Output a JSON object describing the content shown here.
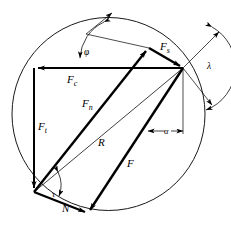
{
  "diagram": {
    "name": "merchant-force-circle",
    "background": "#ffffff",
    "stroke_color": "#000000",
    "canvas": {
      "width": 231,
      "height": 238
    }
  },
  "circle": {
    "name": "merchant-circle",
    "cx": 108.5,
    "cy": 114,
    "r": 96.5,
    "stroke_width": 0.9
  },
  "vertices": {
    "tool_tip": {
      "x": 34,
      "y": 192
    },
    "top_right": {
      "x": 183,
      "y": 68
    },
    "top_left": {
      "x": 34,
      "y": 68
    },
    "shear_apex": {
      "x": 149,
      "y": 48
    },
    "bottom_apex": {
      "x": 88,
      "y": 213
    }
  },
  "forces": [
    {
      "id": "Fc",
      "label": "F",
      "sub": "c",
      "name": "cutting-force",
      "description": "Cutting force, horizontal component",
      "x1": 183,
      "y1": 68,
      "x2": 34,
      "y2": 68,
      "label_x": 67,
      "label_y": 82,
      "stroke_width": 2.0,
      "arrow": "end"
    },
    {
      "id": "Ft",
      "label": "F",
      "sub": "t",
      "name": "thrust-force",
      "description": "Thrust force, vertical component",
      "x1": 34,
      "y1": 68,
      "x2": 34,
      "y2": 192,
      "label_x": 38,
      "label_y": 128,
      "stroke_width": 2.0,
      "arrow": "end"
    },
    {
      "id": "Fn",
      "label": "F",
      "sub": "n",
      "name": "normal-force-shear-plane",
      "description": "Normal force on the shear plane",
      "x1": 34,
      "y1": 192,
      "x2": 149,
      "y2": 48,
      "label_x": 83,
      "label_y": 105,
      "stroke_width": 2.4,
      "arrow": "end"
    },
    {
      "id": "Fs",
      "label": "F",
      "sub": "s",
      "name": "shear-force",
      "description": "Shear force along the shear plane",
      "x1": 149,
      "y1": 48,
      "x2": 183,
      "y2": 68,
      "label_x": 161,
      "label_y": 47,
      "stroke_width": 2.4,
      "arrow": "end"
    },
    {
      "id": "R",
      "label": "R",
      "sub": "",
      "name": "resultant-force",
      "description": "Resultant force (circle diameter)",
      "x1": 183,
      "y1": 68,
      "x2": 34,
      "y2": 192,
      "label_x": 99,
      "label_y": 143,
      "stroke_width": 0.8,
      "arrow": "none"
    },
    {
      "id": "F",
      "label": "F",
      "sub": "",
      "name": "friction-force",
      "description": "Friction force along the tool rake face",
      "x1": 183,
      "y1": 68,
      "x2": 88,
      "y2": 213,
      "label_x": 128,
      "label_y": 165,
      "stroke_width": 2.4,
      "arrow": "end"
    },
    {
      "id": "N",
      "label": "N",
      "sub": "",
      "name": "normal-force-rake-face",
      "description": "Normal force on the tool rake face",
      "x1": 34,
      "y1": 192,
      "x2": 88,
      "y2": 213,
      "label_x": 66,
      "label_y": 209,
      "stroke_width": 2.4,
      "arrow": "end"
    }
  ],
  "angles": [
    {
      "id": "phi",
      "symbol": "φ",
      "name": "shear-angle-phi",
      "description": "Shear plane angle",
      "label_x": 88,
      "label_y": 52
    },
    {
      "id": "lambda",
      "symbol": "λ",
      "name": "friction-angle-lambda",
      "description": "Friction angle at the tool rake face",
      "label_x": 211,
      "label_y": 66
    },
    {
      "id": "alpha",
      "symbol": "α",
      "name": "rake-angle-alpha",
      "description": "Tool rake angle",
      "label_x": 156,
      "label_y": 134
    },
    {
      "id": "tau",
      "symbol": "τ",
      "name": "angle-tau",
      "description": "Angle between resultant and normal force at the tool tip",
      "label_x": 55,
      "label_y": 196
    }
  ],
  "construction_lines": [
    {
      "name": "shear-plane-extension",
      "x1": 149,
      "y1": 48,
      "x2": 88,
      "y2": 35
    },
    {
      "name": "phi-reference-ray",
      "x1": 88,
      "y1": 35,
      "x2": 108,
      "y2": 18
    },
    {
      "name": "vertical-reference",
      "x1": 183,
      "y1": 68,
      "x2": 183,
      "y2": 133
    },
    {
      "name": "lambda-ray-upper",
      "x1": 183,
      "y1": 68,
      "x2": 216,
      "y2": 33
    },
    {
      "name": "lambda-ray-lower",
      "x1": 183,
      "y1": 68,
      "x2": 208,
      "y2": 103
    },
    {
      "name": "phi-arc-pointer",
      "x1": 93,
      "y1": 40,
      "x2": 96,
      "y2": 66
    },
    {
      "name": "resultant-extension",
      "x1": 34,
      "y1": 192,
      "x2": 183,
      "y2": 68
    }
  ]
}
